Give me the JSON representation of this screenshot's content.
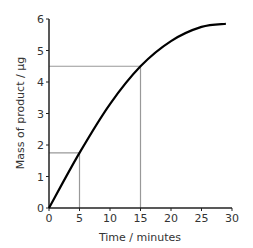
{
  "chart_data": {
    "type": "line",
    "title": "",
    "xlabel": "Time / minutes",
    "ylabel": "Mass of product / µg",
    "xlim": [
      0,
      30
    ],
    "ylim": [
      0,
      6
    ],
    "x_ticks": [
      "0",
      "5",
      "10",
      "15",
      "20",
      "25",
      "30"
    ],
    "y_ticks": [
      "0",
      "1",
      "2",
      "3",
      "4",
      "5",
      "6"
    ],
    "grid": false,
    "legend": null,
    "series": [
      {
        "name": "Mass of product",
        "x": [
          0,
          5,
          10,
          15,
          20,
          25,
          29
        ],
        "y": [
          0,
          1.75,
          3.3,
          4.5,
          5.3,
          5.75,
          5.85
        ]
      }
    ],
    "annotations": [
      {
        "type": "reference-lines",
        "x": 5,
        "y": 1.75
      },
      {
        "type": "reference-lines",
        "x": 15,
        "y": 4.5
      }
    ],
    "colors": {
      "curve": "#000000",
      "axes": "#222222",
      "reference": "#999999"
    }
  }
}
